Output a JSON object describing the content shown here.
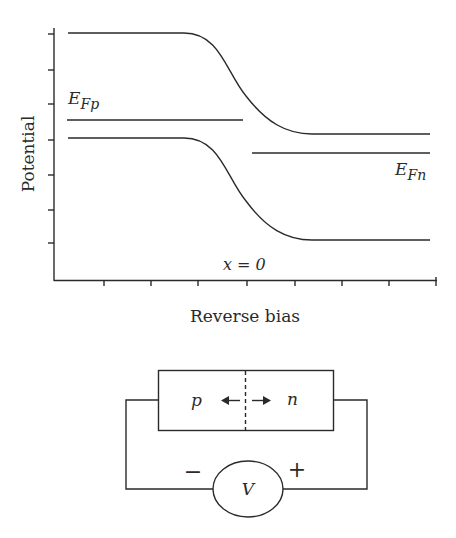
{
  "figure": {
    "top_panel": {
      "title": "Band diagram under reverse bias",
      "y_axis_label": "Potential",
      "x_axis_label": "Reverse bias",
      "position_label": "x = 0",
      "fermi_level_p_label": "E",
      "fermi_level_p_sub": "Fp",
      "fermi_level_n_label": "E",
      "fermi_level_n_sub": "Fn"
    },
    "bottom_panel": {
      "p_label": "p",
      "n_label": "n",
      "voltage_label": "V",
      "minus_label": "−",
      "plus_label": "+"
    },
    "colors": {
      "line": "#2a2a2a",
      "background": "#ffffff"
    }
  }
}
